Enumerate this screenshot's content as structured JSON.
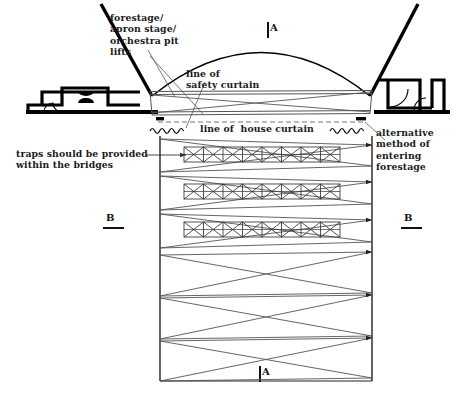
{
  "diagram": {
    "type": "architectural-section-plan",
    "colors": {
      "ink": "#000000",
      "thin_line": "#555555",
      "background": "#ffffff"
    }
  },
  "labels": {
    "forestage": "forestage/\napron stage/\norchestra pit\nlifts",
    "safety_curtain": "line of\nsafety curtain",
    "house_curtain": "line of  house curtain",
    "traps": "traps should be provided\nwithin the bridges",
    "alternative": "alternative\nmethod of\nentering\nforestage"
  },
  "section_marks": {
    "a_top": "A",
    "a_bottom": "A",
    "b_left": "B",
    "b_right": "B"
  },
  "plan": {
    "left_wall_x": 160,
    "right_wall_x": 372,
    "top_y": 136,
    "bottom_y": 381,
    "bridges": [
      {
        "name": "bridge-1",
        "y": 147,
        "height": 15,
        "cells": 8
      },
      {
        "name": "bridge-2",
        "y": 184,
        "height": 15,
        "cells": 8
      },
      {
        "name": "bridge-3",
        "y": 222,
        "height": 15,
        "cells": 8
      }
    ],
    "lift_bands": [
      {
        "name": "lift-band-1",
        "top": 139,
        "bottom": 172
      },
      {
        "name": "lift-band-2",
        "top": 176,
        "bottom": 210
      },
      {
        "name": "lift-band-3",
        "top": 214,
        "bottom": 248
      },
      {
        "name": "lift-band-4",
        "top": 252,
        "bottom": 296
      },
      {
        "name": "lift-band-5",
        "top": 296,
        "bottom": 339
      },
      {
        "name": "lift-band-6",
        "top": 339,
        "bottom": 381
      }
    ]
  },
  "section": {
    "dome_apex_y": 45,
    "dome_left_x": 152,
    "dome_right_x": 370,
    "safety_curtain_y": 92,
    "stage_floor_y": 113,
    "house_curtain_dash_y": 122
  }
}
